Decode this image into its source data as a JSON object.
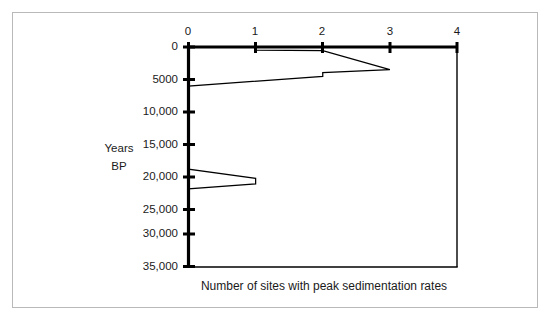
{
  "figure": {
    "background_color": "#ffffff",
    "frame_color": "#b9b9b9",
    "line_color": "#000000"
  },
  "chart_data": {
    "type": "line",
    "title": "",
    "subtitle": "",
    "xlabel": "Number of sites with peak sedimentation rates",
    "ylabel": "Years BP",
    "ylabel_line1": "Years",
    "ylabel_line2": "BP",
    "orientation": "x-axis on top, y-axis inverted (depth/age increasing downward)",
    "grid": false,
    "legend": null,
    "xlim": [
      0,
      4
    ],
    "ylim": [
      0,
      36000
    ],
    "y_axis_inverted": true,
    "x_ticks": [
      0,
      1,
      2,
      3,
      4
    ],
    "x_tick_labels": [
      "0",
      "1",
      "2",
      "3",
      "4"
    ],
    "y_ticks": [
      0,
      5000,
      10000,
      15000,
      20000,
      25000,
      30000,
      35000
    ],
    "y_tick_labels": [
      "0",
      "5000",
      "10,000",
      "15,000",
      "20,000",
      "25,000",
      "30,000",
      "35,000"
    ],
    "series": [
      {
        "name": "Number of sites with peak sedimentation rates",
        "x": [
          0,
          1,
          1,
          2,
          3,
          2,
          2,
          0,
          0,
          1,
          1,
          0,
          0
        ],
        "y": [
          0,
          0,
          500,
          600,
          3700,
          4200,
          4800,
          6400,
          20000,
          21500,
          22400,
          23200,
          36000
        ],
        "points": [
          {
            "sites": 0,
            "years_bp": 0
          },
          {
            "sites": 1,
            "years_bp": 0
          },
          {
            "sites": 1,
            "years_bp": 500
          },
          {
            "sites": 2,
            "years_bp": 600
          },
          {
            "sites": 3,
            "years_bp": 3700
          },
          {
            "sites": 2,
            "years_bp": 4200
          },
          {
            "sites": 2,
            "years_bp": 4800
          },
          {
            "sites": 0,
            "years_bp": 6400
          },
          {
            "sites": 0,
            "years_bp": 20000
          },
          {
            "sites": 1,
            "years_bp": 21500
          },
          {
            "sites": 1,
            "years_bp": 22400
          },
          {
            "sites": 0,
            "years_bp": 23200
          },
          {
            "sites": 0,
            "years_bp": 36000
          }
        ]
      }
    ],
    "annotations": []
  }
}
